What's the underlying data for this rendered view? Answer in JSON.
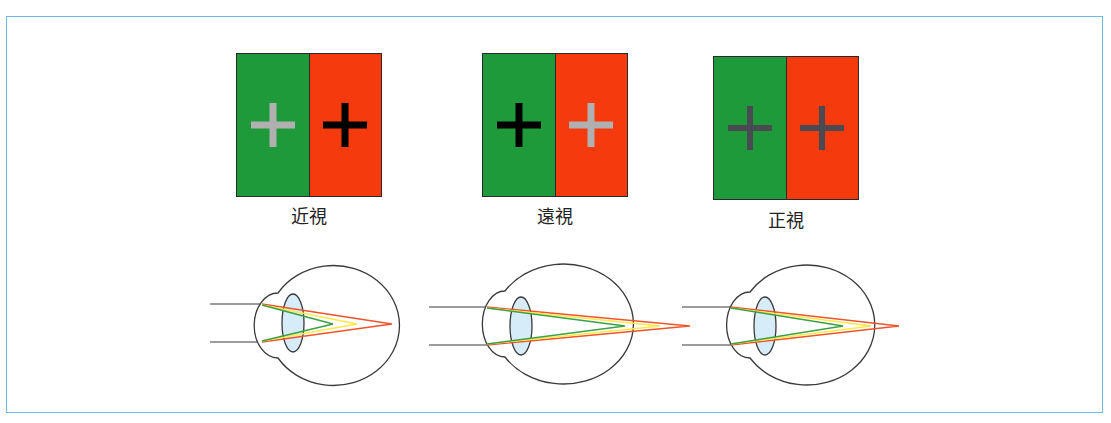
{
  "panels": [
    {
      "label": "近視",
      "left_cross_color": "#b0b0b0",
      "right_cross_color": "#000000",
      "left_cross_width": "7px",
      "right_cross_width": "7px"
    },
    {
      "label": "遠視",
      "left_cross_color": "#000000",
      "right_cross_color": "#b0b0b0",
      "left_cross_width": "7px",
      "right_cross_width": "7px"
    },
    {
      "label": "正視",
      "left_cross_color": "#4a4a52",
      "right_cross_color": "#4a4a52",
      "left_cross_width": "6px",
      "right_cross_width": "6px"
    }
  ],
  "colors": {
    "frame": "#6fb8e0",
    "green_half": "#1f9a3a",
    "red_half": "#f53a0e",
    "lens_fill": "#d6ecf8",
    "ray_red": "#f0542a",
    "ray_yellow": "#ffe94a",
    "ray_green": "#3aa048",
    "eye_outline": "#3a3a3a"
  },
  "eyes": [
    {
      "name": "myopia-eye",
      "focus_note": "green focus inside eye, red reaches retina"
    },
    {
      "name": "hyperopia-eye",
      "focus_note": "green focus at retina, red focuses behind eye"
    },
    {
      "name": "emmetropia-eye",
      "focus_note": "yellow focus at retina"
    }
  ]
}
